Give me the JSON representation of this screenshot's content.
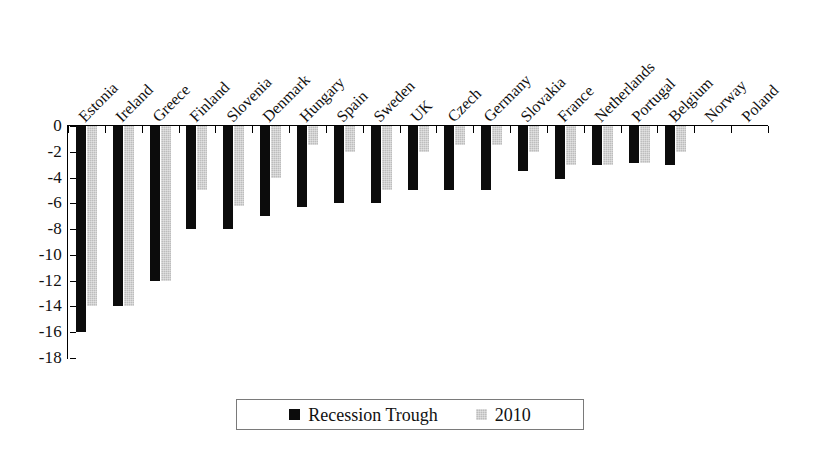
{
  "chart_data": {
    "type": "bar",
    "title": "",
    "subtitle": "",
    "xlabel": "",
    "ylabel": "",
    "ylim": [
      -18,
      0
    ],
    "yticks": [
      0,
      -2,
      -4,
      -6,
      -8,
      -10,
      -12,
      -14,
      -16,
      -18
    ],
    "ytick_labels": [
      "0",
      "-2",
      "-4",
      "-6",
      "-8",
      "-10",
      "-12",
      "-14",
      "-16",
      "-18"
    ],
    "grid": false,
    "legend_position": "bottom-center",
    "categories": [
      "Estonia",
      "Ireland",
      "Greece",
      "Finland",
      "Slovenia",
      "Denmark",
      "Hungary",
      "Spain",
      "Sweden",
      "UK",
      "Czech",
      "Germany",
      "Slovakia",
      "France",
      "Netherlands",
      "Portugal",
      "Belgium",
      "Norway",
      "Poland"
    ],
    "series": [
      {
        "name": "Recession Trough",
        "color": "#0c0c0c",
        "values": [
          -16.0,
          -14.0,
          -12.0,
          -8.0,
          -8.0,
          -7.0,
          -6.3,
          -6.0,
          -6.0,
          -5.0,
          -5.0,
          -5.0,
          -3.5,
          -4.1,
          -3.0,
          -2.9,
          -3.0,
          0.0,
          0.0
        ]
      },
      {
        "name": "2010",
        "color": "#bdbdbd",
        "values": [
          -14.0,
          -14.0,
          -12.0,
          -5.0,
          -6.2,
          -4.0,
          -1.5,
          -2.0,
          -5.0,
          -2.0,
          -1.5,
          -1.5,
          -2.0,
          -3.0,
          -3.0,
          -2.9,
          -2.0,
          0.0,
          0.0
        ]
      }
    ]
  },
  "legend": {
    "items": [
      {
        "label": "Recession Trough",
        "swatch": "black-square-icon"
      },
      {
        "label": "2010",
        "swatch": "gray-square-icon"
      }
    ]
  }
}
